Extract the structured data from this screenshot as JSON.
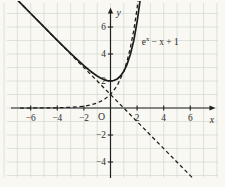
{
  "figure": {
    "background_color": "#f9f8f3",
    "grid_color": "#cdd6ce",
    "axis_color": "#1f1f1f",
    "curve_color": "#1c1c1c",
    "text_color": "#2b2b2b"
  },
  "chart_data": {
    "type": "line",
    "title": "",
    "xlabel": "x",
    "ylabel": "y",
    "origin_label": "O",
    "xlim": [
      -7.7,
      8.1
    ],
    "ylim": [
      -5.8,
      8.0
    ],
    "x_ticks": [
      -6,
      -4,
      -2,
      2,
      4,
      6
    ],
    "y_ticks": [
      -4,
      -2,
      2,
      4,
      6
    ],
    "grid": true,
    "legend": "none",
    "annotation": {
      "text": "e^x − x + 1",
      "base": "e",
      "sup": "x",
      "rest": " − x + 1",
      "anchor_x": 2.35,
      "anchor_y": 4.7
    },
    "series": [
      {
        "name": "y = e^x − x + 1",
        "style": "solid",
        "points": [
          [
            -7.5,
            8.501
          ],
          [
            -7.0,
            8.001
          ],
          [
            -6.5,
            7.502
          ],
          [
            -6.0,
            7.002
          ],
          [
            -5.5,
            6.504
          ],
          [
            -5.0,
            6.007
          ],
          [
            -4.5,
            5.511
          ],
          [
            -4.0,
            5.018
          ],
          [
            -3.5,
            4.53
          ],
          [
            -3.0,
            4.05
          ],
          [
            -2.5,
            3.582
          ],
          [
            -2.0,
            3.135
          ],
          [
            -1.75,
            2.924
          ],
          [
            -1.5,
            2.723
          ],
          [
            -1.25,
            2.537
          ],
          [
            -1.0,
            2.368
          ],
          [
            -0.75,
            2.222
          ],
          [
            -0.5,
            2.107
          ],
          [
            -0.25,
            2.029
          ],
          [
            0,
            2.0
          ],
          [
            0.25,
            2.034
          ],
          [
            0.5,
            2.149
          ],
          [
            0.75,
            2.367
          ],
          [
            1.0,
            2.718
          ],
          [
            1.25,
            3.24
          ],
          [
            1.5,
            3.982
          ],
          [
            1.75,
            5.005
          ],
          [
            2.0,
            6.389
          ],
          [
            2.1,
            7.066
          ],
          [
            2.2,
            7.825
          ],
          [
            2.3,
            8.674
          ]
        ]
      },
      {
        "name": "y = e^x",
        "style": "dashed",
        "points": [
          [
            -6.8,
            0.001
          ],
          [
            -6.0,
            0.002
          ],
          [
            -5.0,
            0.007
          ],
          [
            -4.0,
            0.018
          ],
          [
            -3.0,
            0.05
          ],
          [
            -2.5,
            0.082
          ],
          [
            -2.0,
            0.135
          ],
          [
            -1.5,
            0.223
          ],
          [
            -1.0,
            0.368
          ],
          [
            -0.5,
            0.607
          ],
          [
            0,
            1.0
          ],
          [
            0.5,
            1.649
          ],
          [
            1.0,
            2.718
          ],
          [
            1.25,
            3.49
          ],
          [
            1.5,
            4.482
          ],
          [
            1.75,
            5.755
          ],
          [
            2.0,
            7.389
          ],
          [
            2.15,
            8.585
          ]
        ]
      },
      {
        "name": "y = 1 − x",
        "style": "dashed",
        "points": [
          [
            -7.3,
            8.3
          ],
          [
            6.5,
            -5.5
          ]
        ]
      }
    ]
  }
}
